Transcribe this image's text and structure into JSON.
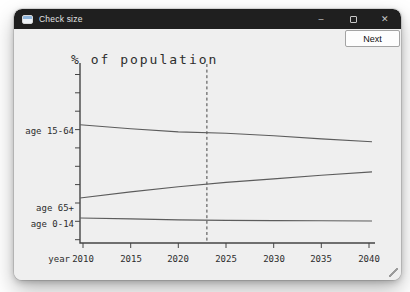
{
  "window": {
    "title": "Check size",
    "controls": {
      "minimize_glyph": "–",
      "close_glyph": "✕"
    }
  },
  "toolbar": {
    "next_label": "Next"
  },
  "chart_data": {
    "type": "line",
    "title": "% of population",
    "xlabel": "year",
    "x": [
      2010,
      2015,
      2020,
      2025,
      2030,
      2035,
      2040
    ],
    "x_tick_labels": [
      "2010",
      "2015",
      "2020",
      "2025",
      "2030",
      "2035",
      "2040"
    ],
    "series": [
      {
        "name": "age 15-64",
        "values": [
          64.4,
          62.2,
          60.5,
          59.7,
          58.4,
          56.7,
          55.1
        ],
        "label_y_pct": 61.0
      },
      {
        "name": "age 65+",
        "values": [
          24.5,
          27.8,
          30.6,
          33.0,
          34.9,
          36.9,
          38.7
        ],
        "label_y_pct": 19.0
      },
      {
        "name": "age 0-14",
        "values": [
          13.6,
          13.1,
          12.6,
          12.3,
          12.2,
          12.1,
          12.0
        ],
        "label_y_pct": 10.3
      }
    ],
    "reference_line_x": 2023,
    "xlim": [
      2010,
      2040
    ],
    "ylim": [
      0,
      98
    ],
    "grid": false,
    "y_axis_ticks": "unlabeled",
    "legend": "inline-left-labels",
    "colors": {
      "ink": "#2d2d2d",
      "line": "#5c5c5c",
      "axis": "#454545"
    }
  }
}
